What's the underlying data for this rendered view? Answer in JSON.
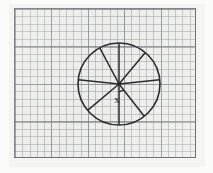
{
  "document": {
    "kind": "hand-drawn geometry figure on graph paper",
    "title": "Circle divided into sectors with unknown angle x"
  },
  "canvas": {
    "width": 213,
    "height": 173,
    "background": "#f4f4f2"
  },
  "paper": {
    "label": "graph-paper-sheet",
    "x": 14,
    "y": 8,
    "width": 182,
    "height": 150,
    "fill": "#ececea",
    "minor_grid_color": "#82848c",
    "major_grid_color": "#6e7078",
    "minor_spacing_px": 7.3,
    "major_every": 5,
    "border_color": "#646670"
  },
  "figure": {
    "ink_color": "#2b2b2e",
    "stroke_width": 1.5,
    "circle": {
      "name": "circle-outline",
      "cx": 119,
      "cy": 84,
      "r": 41
    },
    "center_dot": {
      "name": "center-point",
      "cx": 119,
      "cy": 84,
      "r": 2.1
    },
    "sector_count": 8,
    "radii": [
      {
        "name": "radius-up",
        "angle_deg": 90
      },
      {
        "name": "radius-up-right",
        "angle_deg": 50
      },
      {
        "name": "radius-right",
        "angle_deg": 6
      },
      {
        "name": "radius-down-right",
        "angle_deg": -52
      },
      {
        "name": "radius-down",
        "angle_deg": -90
      },
      {
        "name": "radius-down-left",
        "angle_deg": -140
      },
      {
        "name": "radius-left",
        "angle_deg": 174
      },
      {
        "name": "radius-up-left",
        "angle_deg": 118
      }
    ],
    "angle_marker": {
      "name": "angle-arc",
      "cx": 119,
      "cy": 84,
      "radius": 8,
      "start_deg": -90,
      "end_deg": -52
    },
    "label": {
      "name": "angle-label-x",
      "text": "x",
      "x": 117,
      "y": 103
    }
  }
}
